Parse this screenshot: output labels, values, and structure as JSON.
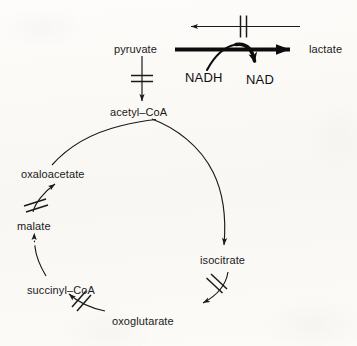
{
  "diagram": {
    "type": "metabolic-pathway",
    "background_color": "#fbfaf7",
    "ink_color": "#1a1a1a",
    "nodes": {
      "pyruvate": "pyruvate",
      "lactate": "lactate",
      "acetyl_coa": "acetyl–CoA",
      "oxaloacetate": "oxaloacetate",
      "malate": "malate",
      "succinyl_coa": "succinyl–CoA",
      "oxoglutarate": "oxoglutarate",
      "isocitrate": "isocitrate"
    },
    "cofactors": {
      "nadh": "NADH",
      "nad": "NAD"
    },
    "edges": [
      {
        "id": "lactate-to-pyruvate-feedback",
        "from": "lactate",
        "to": "pyruvate",
        "style": "straight",
        "direction": "leftward",
        "blocked": true,
        "block_marks": 2,
        "note": "upper reverse arrow, blocked by double bar"
      },
      {
        "id": "pyruvate-to-lactate",
        "from": "pyruvate",
        "to": "lactate",
        "style": "straight-bold",
        "direction": "rightward",
        "blocked": false,
        "note": "thick favoured arrow"
      },
      {
        "id": "nadh-to-nad",
        "from": "nadh",
        "to": "nad",
        "style": "curved-bold",
        "direction": "clockwise",
        "blocked": false,
        "note": "cofactor arc crossing the pyruvate to lactate arrow"
      },
      {
        "id": "pyruvate-to-acetyl-coa",
        "from": "pyruvate",
        "to": "acetyl_coa",
        "style": "straight",
        "direction": "downward",
        "blocked": true,
        "block_marks": 2
      },
      {
        "id": "acetyl-coa-to-isocitrate",
        "from": "acetyl_coa",
        "to": "isocitrate",
        "style": "arc-right",
        "direction": "clockwise",
        "blocked": false
      },
      {
        "id": "isocitrate-to-oxoglutarate",
        "from": "isocitrate",
        "to": "oxoglutarate",
        "style": "arc",
        "direction": "clockwise",
        "blocked": true,
        "block_marks": 2
      },
      {
        "id": "oxoglutarate-to-succinyl-coa",
        "from": "oxoglutarate",
        "to": "succinyl_coa",
        "style": "arc",
        "direction": "clockwise",
        "blocked": true,
        "block_marks": 2
      },
      {
        "id": "succinyl-coa-to-malate",
        "from": "succinyl_coa",
        "to": "malate",
        "style": "arc-dashed",
        "direction": "clockwise",
        "blocked": false
      },
      {
        "id": "malate-to-oxaloacetate",
        "from": "malate",
        "to": "oxaloacetate",
        "style": "straight",
        "direction": "upward",
        "blocked": true,
        "block_marks": 2
      },
      {
        "id": "oxaloacetate-to-acetyl-coa",
        "from": "oxaloacetate",
        "to": "acetyl_coa",
        "style": "arc-top",
        "direction": "clockwise",
        "blocked": false
      }
    ]
  }
}
